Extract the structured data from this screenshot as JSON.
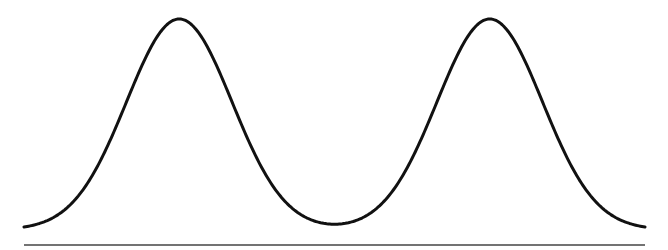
{
  "chart_data": {
    "type": "line",
    "title": "",
    "subtitle": "",
    "xlabel": "",
    "ylabel": "",
    "grid": false,
    "legend": null,
    "xlim": [
      0,
      1
    ],
    "ylim": [
      0,
      1
    ],
    "series": [
      {
        "name": "density",
        "components": [
          {
            "mean": 0.25,
            "sd": 0.085,
            "weight": 1.0
          },
          {
            "mean": 0.75,
            "sd": 0.085,
            "weight": 1.0
          }
        ],
        "x": [
          0.0,
          0.05,
          0.1,
          0.15,
          0.2,
          0.25,
          0.3,
          0.35,
          0.4,
          0.45,
          0.5,
          0.55,
          0.6,
          0.65,
          0.7,
          0.75,
          0.8,
          0.85,
          0.9,
          0.95,
          1.0
        ],
        "values": [
          0.01,
          0.05,
          0.21,
          0.5,
          0.84,
          1.0,
          0.84,
          0.5,
          0.21,
          0.07,
          0.03,
          0.07,
          0.21,
          0.5,
          0.84,
          1.0,
          0.84,
          0.5,
          0.21,
          0.05,
          0.01
        ]
      }
    ],
    "style": {
      "line_color": "#111111",
      "line_width": 3,
      "baseline_color": "#444444",
      "baseline_width": 1.5
    }
  },
  "layout": {
    "plot_left_px": 24,
    "plot_right_px": 645,
    "peak_top_px": 19,
    "curve_bottom_px": 227,
    "baseline_y_px": 245
  }
}
